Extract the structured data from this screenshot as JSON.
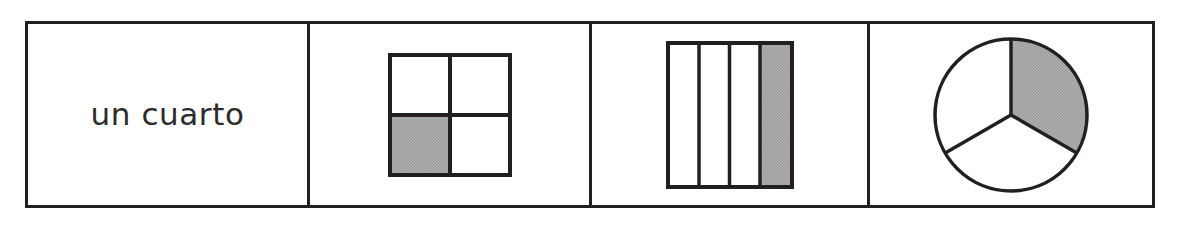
{
  "worksheet": {
    "title": "un cuarto",
    "term": "un cuarto",
    "stroke_color": "#231f20",
    "fill_color": "#a9a9a9",
    "background_color": "#ffffff"
  },
  "cells": [
    {
      "id": "label",
      "kind": "text",
      "text": "un cuarto"
    },
    {
      "id": "square-quarters",
      "kind": "shape",
      "shape": "square-grid",
      "rows": 2,
      "columns": 2,
      "total_parts": 4,
      "shaded_parts": 1,
      "shaded_positions": "bottom-left",
      "fraction": "1/4"
    },
    {
      "id": "bar-quarters",
      "kind": "shape",
      "shape": "vertical-bars",
      "rows": 1,
      "columns": 4,
      "total_parts": 4,
      "shaded_parts": 1,
      "shaded_positions": "rightmost",
      "fraction": "1/4"
    },
    {
      "id": "circle-thirds",
      "kind": "shape",
      "shape": "pie-circle",
      "total_parts": 3,
      "shaded_parts": 1,
      "shaded_positions": "upper-right",
      "fraction": "1/3"
    }
  ]
}
